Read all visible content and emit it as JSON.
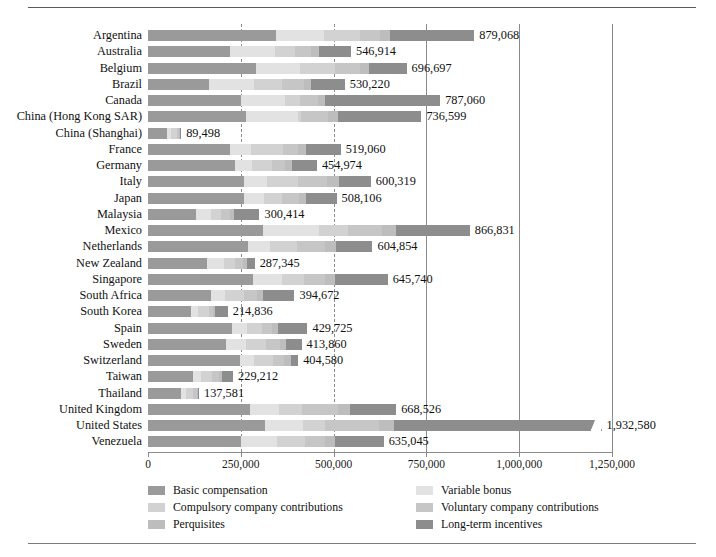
{
  "chart_data": {
    "type": "bar",
    "orientation": "horizontal",
    "stacked": true,
    "title": "",
    "xlabel": "",
    "ylabel": "",
    "xlim": [
      0,
      1250000
    ],
    "grid": true,
    "gridlines": [
      250000,
      500000,
      750000,
      1000000,
      1250000
    ],
    "xticks": [
      0,
      250000,
      500000,
      750000,
      1000000,
      1250000
    ],
    "xticklabels": [
      "0",
      "250,000",
      "500,000",
      "750,000",
      "1,000,000",
      "1,250,000"
    ],
    "legend_position": "bottom",
    "series": [
      {
        "name": "Basic compensation",
        "key": "basic",
        "color": "#9a9a9a"
      },
      {
        "name": "Variable bonus",
        "key": "varbonus",
        "color": "#e2e2e2"
      },
      {
        "name": "Compulsory company contributions",
        "key": "compul",
        "color": "#d2d2d2"
      },
      {
        "name": "Voluntary company contributions",
        "key": "volunt",
        "color": "#c6c6c6"
      },
      {
        "name": "Perquisites",
        "key": "perq",
        "color": "#bdbdbd"
      },
      {
        "name": "Long-term incentives",
        "key": "lti",
        "color": "#8d8d8d"
      }
    ],
    "categories": [
      "Argentina",
      "Australia",
      "Belgium",
      "Brazil",
      "Canada",
      "China (Hong Kong SAR)",
      "China (Shanghai)",
      "France",
      "Germany",
      "Italy",
      "Japan",
      "Malaysia",
      "Mexico",
      "Netherlands",
      "New Zealand",
      "Singapore",
      "South Africa",
      "South Korea",
      "Spain",
      "Sweden",
      "Switzerland",
      "Taiwan",
      "Thailand",
      "United Kingdom",
      "United States",
      "Venezuela"
    ],
    "totals": [
      879068,
      546914,
      696697,
      530220,
      787060,
      736599,
      89498,
      519060,
      454974,
      600319,
      508106,
      300414,
      866831,
      604854,
      287345,
      645740,
      394672,
      214836,
      429725,
      413860,
      404580,
      229212,
      137581,
      668526,
      1932580,
      635045
    ],
    "total_labels": [
      "879,068",
      "546,914",
      "696,697",
      "530,220",
      "787,060",
      "736,599",
      "89,498",
      "519,060",
      "454,974",
      "600,319",
      "508,106",
      "300,414",
      "866,831",
      "604,854",
      "287,345",
      "645,740",
      "394,672",
      "214,836",
      "429,725",
      "413,860",
      "404,580",
      "229,212",
      "137,581",
      "668,526",
      "1,932,580",
      "635,045"
    ],
    "rows": [
      {
        "category": "Argentina",
        "total": 879068,
        "label": "879,068",
        "segments": [
          345000,
          130000,
          95000,
          56000,
          27000,
          226068
        ]
      },
      {
        "category": "Australia",
        "total": 546914,
        "label": "546,914",
        "segments": [
          222000,
          120000,
          53000,
          45000,
          22000,
          84914
        ]
      },
      {
        "category": "Belgium",
        "total": 696697,
        "label": "696,697",
        "segments": [
          290000,
          120000,
          94000,
          66000,
          26000,
          100697
        ]
      },
      {
        "category": "Brazil",
        "total": 530220,
        "label": "530,220",
        "segments": [
          165000,
          120000,
          75000,
          60000,
          20000,
          90220
        ]
      },
      {
        "category": "Canada",
        "total": 787060,
        "label": "787,060",
        "segments": [
          250000,
          120000,
          40000,
          47000,
          20000,
          310060
        ]
      },
      {
        "category": "China (Hong Kong SAR)",
        "total": 736599,
        "label": "736,599",
        "segments": [
          265000,
          140000,
          8000,
          73000,
          25000,
          225599
        ]
      },
      {
        "category": "China (Shanghai)",
        "total": 89498,
        "label": "89,498",
        "segments": [
          50000,
          12000,
          17000,
          5000,
          3000,
          2498
        ]
      },
      {
        "category": "France",
        "total": 519060,
        "label": "519,060",
        "segments": [
          222000,
          55000,
          86000,
          42000,
          20000,
          94060
        ]
      },
      {
        "category": "Germany",
        "total": 454974,
        "label": "454,974",
        "segments": [
          235000,
          45000,
          55000,
          35000,
          18000,
          66974
        ]
      },
      {
        "category": "Italy",
        "total": 600319,
        "label": "600,319",
        "segments": [
          258000,
          62000,
          85000,
          78000,
          32000,
          85319
        ]
      },
      {
        "category": "Japan",
        "total": 508106,
        "label": "508,106",
        "segments": [
          258000,
          55000,
          48000,
          46000,
          20000,
          81106
        ]
      },
      {
        "category": "Malaysia",
        "total": 300414,
        "label": "300,414",
        "segments": [
          130000,
          40000,
          28000,
          24000,
          10000,
          68414
        ]
      },
      {
        "category": "Mexico",
        "total": 866831,
        "label": "866,831",
        "segments": [
          310000,
          150000,
          80000,
          90000,
          38000,
          198831
        ]
      },
      {
        "category": "Netherlands",
        "total": 604854,
        "label": "604,854",
        "segments": [
          270000,
          60000,
          72000,
          75000,
          30000,
          97854
        ]
      },
      {
        "category": "New Zealand",
        "total": 287345,
        "label": "287,345",
        "segments": [
          158000,
          48000,
          28000,
          23000,
          10000,
          20345
        ]
      },
      {
        "category": "Singapore",
        "total": 645740,
        "label": "645,740",
        "segments": [
          282000,
          78000,
          60000,
          58000,
          27000,
          140740
        ]
      },
      {
        "category": "South Africa",
        "total": 394672,
        "label": "394,672",
        "segments": [
          170000,
          38000,
          50000,
          35000,
          18000,
          83672
        ]
      },
      {
        "category": "South Korea",
        "total": 214836,
        "label": "214,836",
        "segments": [
          115000,
          20000,
          28000,
          12000,
          6000,
          33836
        ]
      },
      {
        "category": "Spain",
        "total": 429725,
        "label": "429,725",
        "segments": [
          225000,
          42000,
          40000,
          28000,
          14000,
          80725
        ]
      },
      {
        "category": "Sweden",
        "total": 413860,
        "label": "413,860",
        "segments": [
          210000,
          55000,
          52000,
          38000,
          16000,
          42860
        ]
      },
      {
        "category": "Switzerland",
        "total": 404580,
        "label": "404,580",
        "segments": [
          248000,
          38000,
          52000,
          28000,
          20000,
          18580
        ]
      },
      {
        "category": "Taiwan",
        "total": 229212,
        "label": "229,212",
        "segments": [
          120000,
          23000,
          30000,
          18000,
          8000,
          30212
        ]
      },
      {
        "category": "Thailand",
        "total": 137581,
        "label": "137,581",
        "segments": [
          88000,
          15000,
          18000,
          10000,
          4000,
          2581
        ]
      },
      {
        "category": "United Kingdom",
        "total": 668526,
        "label": "668,526",
        "segments": [
          275000,
          78000,
          62000,
          98000,
          30000,
          125526
        ]
      },
      {
        "category": "United States",
        "total": 1932580,
        "label": "1,932,580",
        "segments": [
          500000,
          160000,
          95000,
          230000,
          65000,
          882580
        ]
      },
      {
        "category": "Venezuela",
        "total": 635045,
        "label": "635,045",
        "segments": [
          250000,
          98000,
          75000,
          55000,
          25000,
          132045
        ]
      }
    ]
  },
  "legend": {
    "left_items": [
      {
        "label": "Basic compensation",
        "color": "#9a9a9a"
      },
      {
        "label": "Compulsory company contributions",
        "color": "#d2d2d2"
      },
      {
        "label": "Perquisites",
        "color": "#bdbdbd"
      }
    ],
    "right_items": [
      {
        "label": "Variable bonus",
        "color": "#e2e2e2"
      },
      {
        "label": "Voluntary company contributions",
        "color": "#c6c6c6"
      },
      {
        "label": "Long-term incentives",
        "color": "#8d8d8d"
      }
    ]
  }
}
